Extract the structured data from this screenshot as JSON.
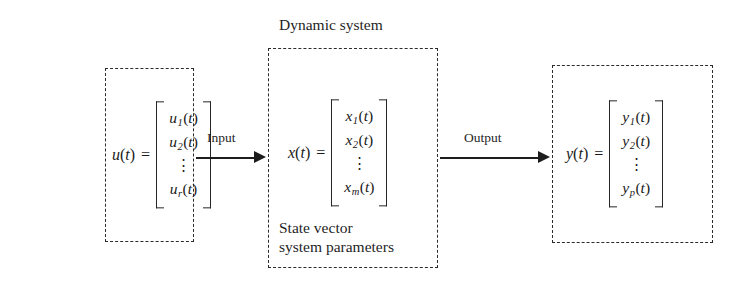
{
  "figure": {
    "background_color": "#ffffff",
    "line_color": "#2b2b2b"
  },
  "system_block": {
    "title": "Dynamic system",
    "caption_line_1": "State vector",
    "caption_line_2": "system parameters",
    "equation": {
      "lhs_var": "x",
      "lhs": "x(t)",
      "equals": "=",
      "rows": [
        "x₁(t)",
        "x₂(t)",
        "⋮",
        "xₘ(t)"
      ],
      "row_1_base": "x",
      "row_1_sub": "1",
      "row_1_arg": "(t)",
      "row_2_base": "x",
      "row_2_sub": "2",
      "row_2_arg": "(t)",
      "row_dots": "⋮",
      "row_n_base": "x",
      "row_n_sub": "m",
      "row_n_arg": "(t)"
    }
  },
  "input_block": {
    "equation": {
      "lhs_var": "u",
      "lhs": "u(t)",
      "equals": "=",
      "rows": [
        "u₁(t)",
        "u₂(t)",
        "⋮",
        "uᵣ(t)"
      ],
      "row_1_base": "u",
      "row_1_sub": "1",
      "row_1_arg": "(t)",
      "row_2_base": "u",
      "row_2_sub": "2",
      "row_2_arg": "(t)",
      "row_dots": "⋮",
      "row_n_base": "u",
      "row_n_sub": "r",
      "row_n_arg": "(t)"
    }
  },
  "output_block": {
    "equation": {
      "lhs_var": "y",
      "lhs": "y(t)",
      "equals": "=",
      "rows": [
        "y₁(t)",
        "y₂(t)",
        "⋮",
        "yₚ(t)"
      ],
      "row_1_base": "y",
      "row_1_sub": "1",
      "row_1_arg": "(t)",
      "row_2_base": "y",
      "row_2_sub": "2",
      "row_2_arg": "(t)",
      "row_dots": "⋮",
      "row_n_base": "y",
      "row_n_sub": "p",
      "row_n_arg": "(t)"
    }
  },
  "arrows": {
    "input_label": "Input",
    "output_label": "Output"
  }
}
